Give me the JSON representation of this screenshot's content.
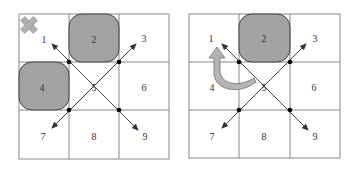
{
  "colors": {
    "grid": "#888888",
    "block_fill": "#a3a3a3",
    "block_stroke": "#444444",
    "arrow": "#333333",
    "dot": "#000000",
    "cross_fill": "#b0b0b0",
    "curve_fill": "#b5b5b5"
  },
  "panels": [
    {
      "id": "left",
      "cells": [
        "1",
        "2",
        "3",
        "4",
        "5",
        "6",
        "7",
        "8",
        "9"
      ],
      "blocked_cells": [
        "2",
        "4"
      ],
      "marker": "cross-icon at cell 1"
    },
    {
      "id": "right",
      "cells": [
        "1",
        "2",
        "3",
        "4",
        "5",
        "6",
        "7",
        "8",
        "9"
      ],
      "blocked_cells": [
        "2"
      ],
      "marker": "curved arrow from 5 to 1"
    }
  ],
  "labels": {
    "l1": "1",
    "l2": "2",
    "l3": "3",
    "l4": "4",
    "l5": "5",
    "l6": "6",
    "l7": "7",
    "l8": "8",
    "l9": "9",
    "r1": "1",
    "r2": "2",
    "r3": "3",
    "r4": "4",
    "r5": "5",
    "r6": "6",
    "r7": "7",
    "r8": "8",
    "r9": "9"
  }
}
